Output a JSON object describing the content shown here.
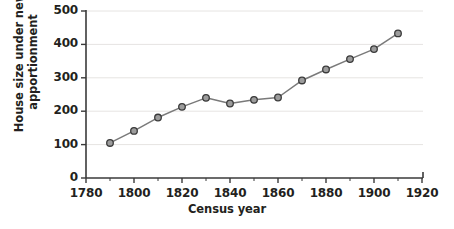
{
  "chart_data": {
    "type": "line",
    "title": "",
    "xlabel": "Census year",
    "ylabel": "House size under new apportionment",
    "ylabel_line1": "House size under new",
    "ylabel_line2": "apportionment",
    "x": [
      1790,
      1800,
      1810,
      1820,
      1830,
      1840,
      1850,
      1860,
      1870,
      1880,
      1890,
      1900,
      1910
    ],
    "values": [
      105,
      141,
      181,
      213,
      240,
      223,
      234,
      241,
      292,
      325,
      356,
      386,
      433
    ],
    "series": [
      {
        "name": "House size under new apportionment",
        "values": [
          105,
          141,
          181,
          213,
          240,
          223,
          234,
          241,
          292,
          325,
          356,
          386,
          433
        ]
      }
    ],
    "xlim": [
      1780,
      1920
    ],
    "ylim": [
      0,
      500
    ],
    "xticks": [
      1780,
      1800,
      1820,
      1840,
      1860,
      1880,
      1900,
      1920
    ],
    "xtick_labels": [
      "1780",
      "1800",
      "1820",
      "1840",
      "1860",
      "1880",
      "1900",
      "1920"
    ],
    "xminor_ticks": [
      1790,
      1810,
      1830,
      1850,
      1870,
      1890,
      1910
    ],
    "yticks": [
      0,
      100,
      200,
      300,
      400,
      500
    ],
    "ytick_labels": [
      "0",
      "100",
      "200",
      "300",
      "400",
      "500"
    ],
    "grid": "horizontal",
    "legend": "none",
    "marker": "circle",
    "colors": {
      "line": "#7a7a7a",
      "marker_fill": "#9c9c9c",
      "marker_stroke": "#3a3a3a",
      "axis": "#3a3a3a",
      "grid": "#e6e4e2",
      "text": "#231f20",
      "background": "#ffffff"
    }
  }
}
